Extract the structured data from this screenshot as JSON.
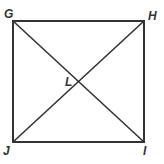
{
  "figure": {
    "shape": "square",
    "vertices": [
      {
        "name": "G",
        "x": 13,
        "y": 21,
        "label_x": 4,
        "label_y": 18
      },
      {
        "name": "H",
        "x": 144,
        "y": 21,
        "label_x": 148,
        "label_y": 20
      },
      {
        "name": "I",
        "x": 144,
        "y": 142,
        "label_x": 143,
        "label_y": 155
      },
      {
        "name": "J",
        "x": 13,
        "y": 142,
        "label_x": 3,
        "label_y": 155
      }
    ],
    "intersection": {
      "name": "L",
      "x": 78,
      "y": 81,
      "label_x": 65,
      "label_y": 86
    },
    "diagonals": [
      "GI",
      "HJ"
    ],
    "stroke_color": "#333333"
  }
}
